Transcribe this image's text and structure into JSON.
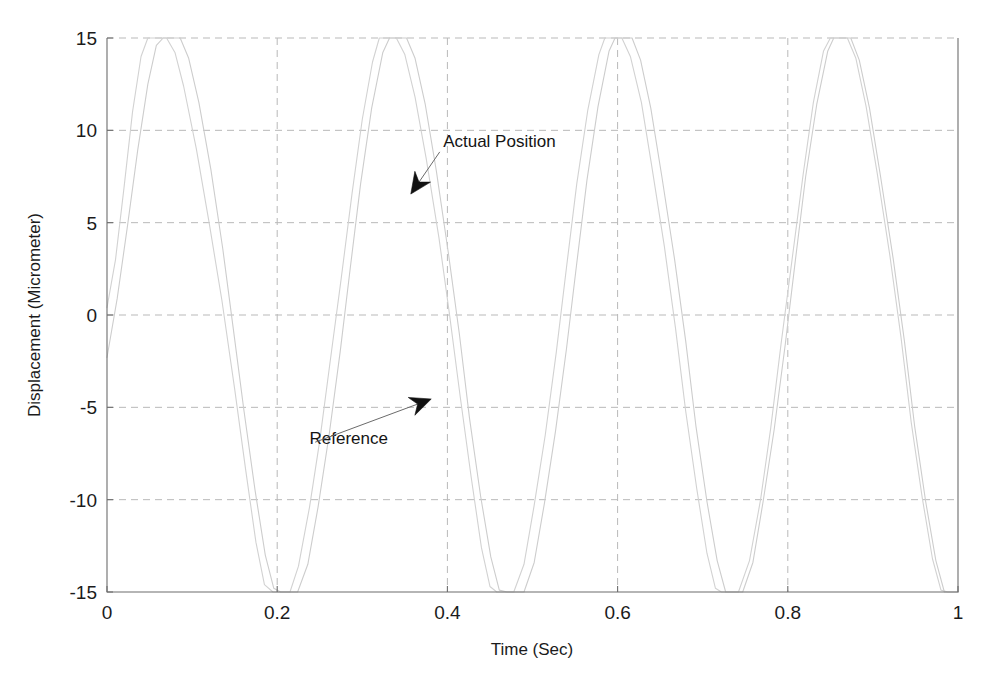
{
  "chart_data": {
    "type": "line",
    "title": "",
    "xlabel": "Time (Sec)",
    "ylabel": "Displacement (Micrometer)",
    "xlim": [
      0,
      1
    ],
    "ylim": [
      -15,
      15
    ],
    "xticks": [
      "0",
      "0.2",
      "0.4",
      "0.6",
      "0.8",
      "1"
    ],
    "xtick_values": [
      0,
      0.2,
      0.4,
      0.6,
      0.8,
      1
    ],
    "yticks": [
      "15",
      "10",
      "5",
      "0",
      "-5",
      "-10",
      "-15"
    ],
    "ytick_values": [
      15,
      10,
      5,
      0,
      -5,
      -10,
      -15
    ],
    "grid": true,
    "grid_style": "dashed",
    "grid_color": "#b9b9b9",
    "axes_color": "#6d6d6d",
    "legend": "none",
    "annotations": [
      {
        "name": "actual-position",
        "text": "Actual Position",
        "text_x": 0.395,
        "text_y": 9.1,
        "arrow_tip_x": 0.357,
        "arrow_tip_y": 6.55
      },
      {
        "name": "reference",
        "text": "Reference",
        "text_x": 0.238,
        "text_y": -7.0,
        "arrow_tip_x": 0.381,
        "arrow_tip_y": -4.55
      }
    ],
    "series": [
      {
        "name": "Reference",
        "color": "#d2d2d2",
        "waveform": "clipped-sine",
        "amplitude": 16.8,
        "clip": 15,
        "period": 0.262,
        "phase_shift": 0.0,
        "points": [
          [
            0.0,
            0.4
          ],
          [
            0.01,
            3.0
          ],
          [
            0.02,
            6.9
          ],
          [
            0.03,
            11.0
          ],
          [
            0.04,
            14.0
          ],
          [
            0.048,
            15.0
          ],
          [
            0.07,
            15.0
          ],
          [
            0.08,
            14.2
          ],
          [
            0.09,
            12.4
          ],
          [
            0.105,
            9.0
          ],
          [
            0.12,
            5.0
          ],
          [
            0.135,
            0.8
          ],
          [
            0.15,
            -4.0
          ],
          [
            0.163,
            -8.4
          ],
          [
            0.175,
            -12.3
          ],
          [
            0.185,
            -14.6
          ],
          [
            0.195,
            -15.0
          ],
          [
            0.215,
            -15.0
          ],
          [
            0.225,
            -13.6
          ],
          [
            0.238,
            -10.4
          ],
          [
            0.25,
            -6.8
          ],
          [
            0.262,
            -2.6
          ],
          [
            0.275,
            1.9
          ],
          [
            0.288,
            6.6
          ],
          [
            0.3,
            10.6
          ],
          [
            0.312,
            13.7
          ],
          [
            0.32,
            15.0
          ],
          [
            0.34,
            15.0
          ],
          [
            0.35,
            14.1
          ],
          [
            0.362,
            11.8
          ],
          [
            0.375,
            8.5
          ],
          [
            0.39,
            4.2
          ],
          [
            0.402,
            0.2
          ],
          [
            0.415,
            -4.4
          ],
          [
            0.428,
            -8.8
          ],
          [
            0.44,
            -12.6
          ],
          [
            0.45,
            -14.7
          ],
          [
            0.458,
            -15.0
          ],
          [
            0.478,
            -15.0
          ],
          [
            0.49,
            -13.5
          ],
          [
            0.502,
            -10.3
          ],
          [
            0.515,
            -6.5
          ],
          [
            0.528,
            -2.0
          ],
          [
            0.54,
            2.6
          ],
          [
            0.552,
            7.1
          ],
          [
            0.565,
            11.1
          ],
          [
            0.578,
            14.1
          ],
          [
            0.585,
            15.0
          ],
          [
            0.605,
            15.0
          ],
          [
            0.615,
            14.0
          ],
          [
            0.628,
            11.5
          ],
          [
            0.64,
            8.1
          ],
          [
            0.655,
            3.7
          ],
          [
            0.668,
            -0.7
          ],
          [
            0.68,
            -5.2
          ],
          [
            0.693,
            -9.4
          ],
          [
            0.705,
            -12.9
          ],
          [
            0.715,
            -14.8
          ],
          [
            0.722,
            -15.0
          ],
          [
            0.742,
            -15.0
          ],
          [
            0.755,
            -13.3
          ],
          [
            0.768,
            -10.0
          ],
          [
            0.78,
            -6.1
          ],
          [
            0.792,
            -1.6
          ],
          [
            0.805,
            3.0
          ],
          [
            0.818,
            7.6
          ],
          [
            0.83,
            11.5
          ],
          [
            0.842,
            14.3
          ],
          [
            0.85,
            15.0
          ],
          [
            0.87,
            15.0
          ],
          [
            0.88,
            13.9
          ],
          [
            0.892,
            11.3
          ],
          [
            0.905,
            7.7
          ],
          [
            0.92,
            3.2
          ],
          [
            0.933,
            -1.2
          ],
          [
            0.945,
            -5.8
          ],
          [
            0.958,
            -9.9
          ],
          [
            0.97,
            -13.2
          ],
          [
            0.98,
            -14.9
          ],
          [
            0.988,
            -15.0
          ],
          [
            1.0,
            -15.0
          ]
        ]
      },
      {
        "name": "Actual Position",
        "color": "#cdcdcd",
        "waveform": "clipped-sine",
        "amplitude": 16.8,
        "clip": 15,
        "period": 0.262,
        "phase_shift": 0.012,
        "points": [
          [
            0.0,
            -2.3
          ],
          [
            0.012,
            0.9
          ],
          [
            0.024,
            4.8
          ],
          [
            0.036,
            8.9
          ],
          [
            0.048,
            12.5
          ],
          [
            0.058,
            14.6
          ],
          [
            0.066,
            15.0
          ],
          [
            0.086,
            15.0
          ],
          [
            0.096,
            13.9
          ],
          [
            0.108,
            11.5
          ],
          [
            0.122,
            7.9
          ],
          [
            0.136,
            3.6
          ],
          [
            0.148,
            -0.6
          ],
          [
            0.161,
            -5.2
          ],
          [
            0.174,
            -9.5
          ],
          [
            0.186,
            -13.0
          ],
          [
            0.196,
            -14.8
          ],
          [
            0.204,
            -15.0
          ],
          [
            0.224,
            -15.0
          ],
          [
            0.236,
            -13.5
          ],
          [
            0.248,
            -10.4
          ],
          [
            0.261,
            -6.5
          ],
          [
            0.274,
            -2.0
          ],
          [
            0.286,
            2.6
          ],
          [
            0.298,
            7.1
          ],
          [
            0.311,
            11.2
          ],
          [
            0.324,
            14.2
          ],
          [
            0.332,
            15.0
          ],
          [
            0.352,
            15.0
          ],
          [
            0.362,
            13.9
          ],
          [
            0.374,
            11.4
          ],
          [
            0.387,
            7.8
          ],
          [
            0.401,
            3.4
          ],
          [
            0.414,
            -1.0
          ],
          [
            0.426,
            -5.6
          ],
          [
            0.439,
            -9.8
          ],
          [
            0.451,
            -13.1
          ],
          [
            0.461,
            -14.9
          ],
          [
            0.47,
            -15.0
          ],
          [
            0.49,
            -15.0
          ],
          [
            0.502,
            -13.4
          ],
          [
            0.514,
            -10.2
          ],
          [
            0.527,
            -6.3
          ],
          [
            0.54,
            -1.8
          ],
          [
            0.552,
            2.8
          ],
          [
            0.564,
            7.3
          ],
          [
            0.577,
            11.3
          ],
          [
            0.59,
            14.3
          ],
          [
            0.597,
            15.0
          ],
          [
            0.617,
            15.0
          ],
          [
            0.627,
            13.8
          ],
          [
            0.639,
            11.2
          ],
          [
            0.652,
            7.5
          ],
          [
            0.667,
            3.0
          ],
          [
            0.68,
            -1.4
          ],
          [
            0.692,
            -6.0
          ],
          [
            0.705,
            -10.1
          ],
          [
            0.717,
            -13.3
          ],
          [
            0.727,
            -15.0
          ],
          [
            0.747,
            -15.0
          ],
          [
            0.759,
            -13.4
          ],
          [
            0.771,
            -10.1
          ],
          [
            0.784,
            -6.2
          ],
          [
            0.797,
            -1.6
          ],
          [
            0.809,
            3.0
          ],
          [
            0.821,
            7.5
          ],
          [
            0.834,
            11.4
          ],
          [
            0.847,
            14.3
          ],
          [
            0.854,
            15.0
          ],
          [
            0.874,
            15.0
          ],
          [
            0.884,
            13.8
          ],
          [
            0.896,
            11.2
          ],
          [
            0.909,
            7.5
          ],
          [
            0.924,
            3.0
          ],
          [
            0.937,
            -1.4
          ],
          [
            0.949,
            -6.0
          ],
          [
            0.962,
            -10.1
          ],
          [
            0.974,
            -13.3
          ],
          [
            0.984,
            -15.0
          ],
          [
            1.0,
            -15.0
          ]
        ]
      }
    ]
  },
  "axis": {
    "x_label": "Time (Sec)",
    "y_label": "Displacement (Micrometer)"
  }
}
